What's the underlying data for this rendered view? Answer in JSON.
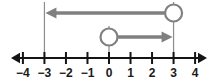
{
  "figure": {
    "type": "number-line-inequality-graph",
    "axis": {
      "min": -4.6,
      "max": 4.6,
      "tick_values": [
        -4,
        -3,
        -2,
        -1,
        0,
        1,
        2,
        3,
        4
      ],
      "tick_labels": [
        "−4",
        "−3",
        "−2",
        "−1",
        "0",
        "1",
        "2",
        "3",
        "4"
      ],
      "color": "#141414",
      "left_arrow": "axis-arrow-left",
      "right_arrow": "axis-arrow-right"
    },
    "rays": [
      {
        "name": "upper-ray",
        "endpoint_value": 3,
        "endpoint_style": "open-circle",
        "direction": "left",
        "terminal_value": -3,
        "arrowhead": "arrow-left",
        "color": "#808080",
        "row": "upper"
      },
      {
        "name": "lower-ray",
        "endpoint_value": 0,
        "endpoint_style": "open-circle",
        "direction": "right",
        "terminal_value": 3,
        "arrowhead": "arrow-right",
        "color": "#808080",
        "row": "lower"
      }
    ],
    "guide_lines": [
      {
        "name": "guide-line-minus-3",
        "value": -3,
        "color": "#8c8c8c",
        "from_y": 2,
        "to_y": 58
      },
      {
        "name": "guide-line-0",
        "value": 0,
        "color": "#8c8c8c",
        "from_y": 26,
        "to_y": 58
      },
      {
        "name": "guide-line-3",
        "value": 3,
        "color": "#8c8c8c",
        "from_y": 2,
        "to_y": 58
      }
    ],
    "colors": {
      "axis": "#141414",
      "ray": "#808080",
      "guide": "#8c8c8c",
      "label": "#1a1a1a",
      "background": "#ffffff"
    }
  }
}
